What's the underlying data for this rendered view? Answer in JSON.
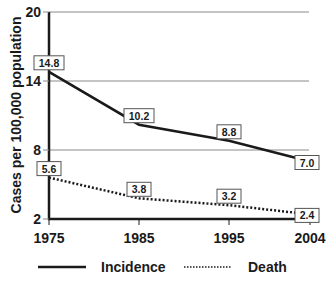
{
  "chart_data": {
    "type": "line",
    "title": "",
    "xlabel": "",
    "ylabel": "Cases per 100,000 population",
    "x": [
      "1975",
      "1985",
      "1995",
      "2004"
    ],
    "x_values": [
      1975,
      1985,
      1995,
      2004
    ],
    "ylim": [
      2,
      20
    ],
    "yticks": [
      2,
      8,
      14,
      20
    ],
    "grid": {
      "horizontal": true,
      "lines_at": [
        8,
        14,
        20
      ]
    },
    "legend_position": "bottom",
    "series": [
      {
        "name": "Incidence",
        "style": "solid",
        "values": [
          14.8,
          10.2,
          8.8,
          7.0
        ],
        "labels": [
          "14.8",
          "10.2",
          "8.8",
          "7.0"
        ]
      },
      {
        "name": "Death",
        "style": "dotted",
        "values": [
          5.6,
          3.8,
          3.2,
          2.4
        ],
        "labels": [
          "5.6",
          "3.8",
          "3.2",
          "2.4"
        ]
      }
    ]
  },
  "legend": {
    "items": [
      {
        "label": "Incidence",
        "style": "solid"
      },
      {
        "label": "Death",
        "style": "dotted"
      }
    ]
  },
  "colors": {
    "line": "#1a1a1a",
    "grid": "#8a8a8a",
    "axis": "#1a1a1a",
    "label_box_border": "#555555",
    "background": "#ffffff"
  }
}
